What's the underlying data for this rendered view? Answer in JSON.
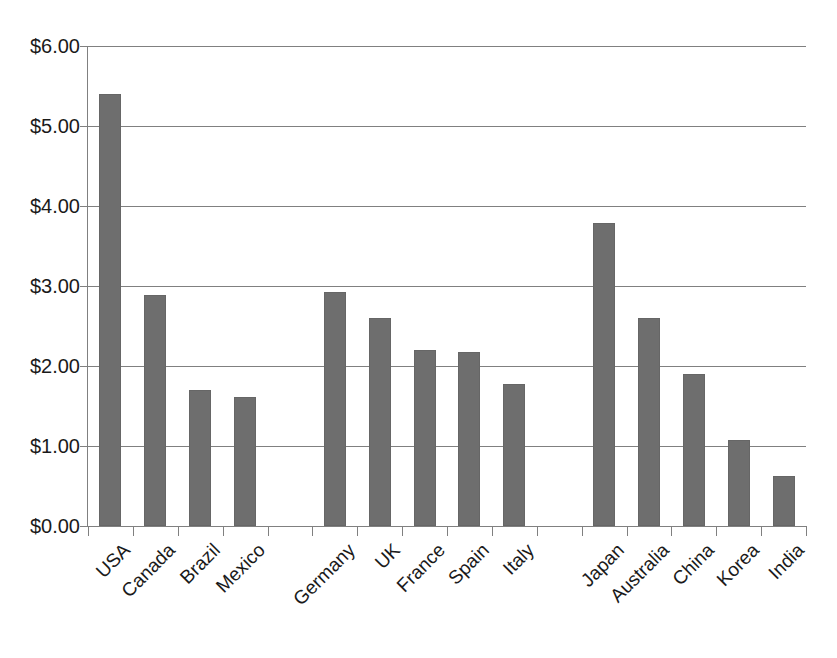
{
  "chart_data": {
    "type": "bar",
    "title": "",
    "subtitle": "",
    "xlabel": "",
    "ylabel": "",
    "categories": [
      "USA",
      "Canada",
      "Brazil",
      "Mexico",
      "",
      "Germany",
      "UK",
      "France",
      "Spain",
      "Italy",
      "",
      "Japan",
      "Australia",
      "China",
      "Korea",
      "India"
    ],
    "values": [
      5.4,
      2.89,
      1.7,
      1.61,
      null,
      2.92,
      2.6,
      2.2,
      2.18,
      1.77,
      null,
      3.79,
      2.6,
      1.9,
      1.07,
      0.62
    ],
    "ylim": [
      0,
      6
    ],
    "ytick_values": [
      0,
      1,
      2,
      3,
      4,
      5,
      6
    ],
    "ytick_labels": [
      "$0.00",
      "$1.00",
      "$2.00",
      "$3.00",
      "$4.00",
      "$5.00",
      "$6.00"
    ],
    "grid": true,
    "legend": null,
    "bar_color": "#6e6e6e",
    "axis_color": "#808080",
    "text_color": "#1a1a1a",
    "background": "#ffffff",
    "group_separators_after": [
      "Mexico",
      "Italy"
    ],
    "series": [
      {
        "name": "",
        "points": [
          {
            "category": "USA",
            "value": 5.4
          },
          {
            "category": "Canada",
            "value": 2.89
          },
          {
            "category": "Brazil",
            "value": 1.7
          },
          {
            "category": "Mexico",
            "value": 1.61
          },
          {
            "category": "Germany",
            "value": 2.92
          },
          {
            "category": "UK",
            "value": 2.6
          },
          {
            "category": "France",
            "value": 2.2
          },
          {
            "category": "Spain",
            "value": 2.18
          },
          {
            "category": "Italy",
            "value": 1.77
          },
          {
            "category": "Japan",
            "value": 3.79
          },
          {
            "category": "Australia",
            "value": 2.6
          },
          {
            "category": "China",
            "value": 1.9
          },
          {
            "category": "Korea",
            "value": 1.07
          },
          {
            "category": "India",
            "value": 0.62
          }
        ]
      }
    ]
  }
}
